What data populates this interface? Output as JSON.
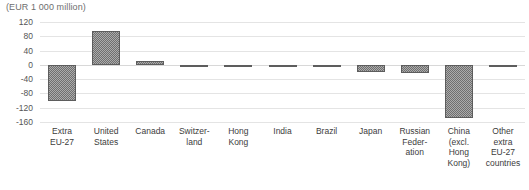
{
  "chart_data": {
    "type": "bar",
    "title": "(EUR 1 000 million)",
    "subtitle": "",
    "xlabel": "",
    "ylabel": "",
    "ylim": [
      -160,
      120
    ],
    "ytick_values": [
      120,
      80,
      40,
      0,
      -40,
      -80,
      -120,
      -160
    ],
    "ytick_labels": [
      "120",
      "80",
      "40",
      "0",
      "-40",
      "-80",
      "-120",
      "-160"
    ],
    "grid": true,
    "legend": false,
    "legend_position": "none",
    "categories": [
      "Extra EU-27",
      "United States",
      "Canada",
      "Switzerland",
      "Hong Kong",
      "India",
      "Brazil",
      "Japan",
      "Russian Federation",
      "China (excl. Hong Kong)",
      "Other extra EU-27 countries"
    ],
    "category_label_lines": [
      [
        "Extra",
        "EU-27"
      ],
      [
        "United",
        "States"
      ],
      [
        "Canada"
      ],
      [
        "Switzer-",
        "land"
      ],
      [
        "Hong",
        "Kong"
      ],
      [
        "India"
      ],
      [
        "Brazil"
      ],
      [
        "Japan"
      ],
      [
        "Russian",
        "Feder-",
        "ation"
      ],
      [
        "China",
        "(excl.",
        "Hong",
        "Kong)"
      ],
      [
        "Other",
        "extra",
        "EU-27",
        "countries"
      ]
    ],
    "values": [
      -100,
      95,
      10,
      -5,
      -3,
      -3,
      -1,
      -20,
      -22,
      -150,
      -7
    ],
    "bar_color": "#6f6f6f",
    "grid_color": "#e4e4e4",
    "text_color": "#3c3c3c",
    "title_color": "#6e6e6e",
    "background_color": "#ffffff"
  }
}
